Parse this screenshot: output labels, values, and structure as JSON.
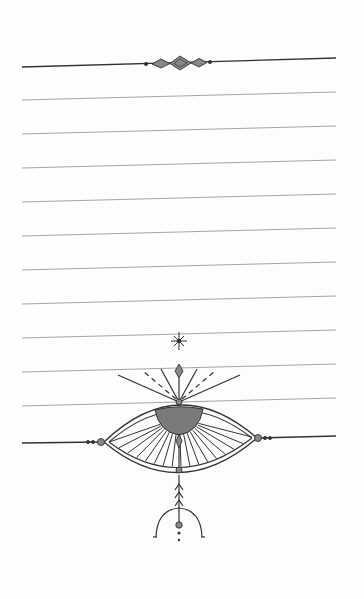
{
  "page": {
    "colors": {
      "background": "#fdfdfd",
      "ruled_line": "#9a9a9a",
      "ink": "#333333",
      "fill": "#7a7a7a"
    },
    "ruled_lines": {
      "count": 10,
      "left_x": 22,
      "right_x": 336,
      "first_left_y": 100,
      "spacing": 34,
      "tilt": 8
    },
    "header_divider": {
      "left_y": 67,
      "right_y": 58
    }
  }
}
